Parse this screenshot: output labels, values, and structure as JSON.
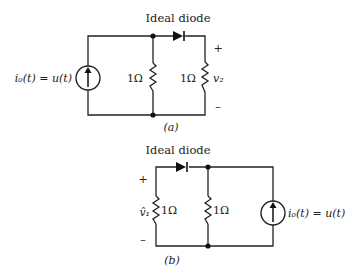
{
  "circuits": [
    {
      "id": "a",
      "caption": "(a)",
      "diode_label": "Ideal diode",
      "source_label": "i₀(t) = u(t)",
      "resistor1_label": "1Ω",
      "resistor2_label": "1Ω",
      "output_voltage_label": "v₂",
      "plus_sign": "+",
      "minus_sign": "–"
    },
    {
      "id": "b",
      "caption": "(b)",
      "diode_label": "Ideal diode",
      "source_label": "i₀(t) = u(t)",
      "resistor1_label": "1Ω",
      "resistor2_label": "1Ω",
      "output_voltage_label": "v̂₁",
      "plus_sign": "+",
      "minus_sign": "–"
    }
  ]
}
